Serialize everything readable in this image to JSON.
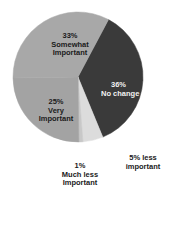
{
  "chart_data": {
    "type": "pie",
    "title": "",
    "start_angle_deg": 28,
    "direction": "clockwise",
    "slices": [
      {
        "label": "No change",
        "value": 36,
        "color": "#3a3a3a"
      },
      {
        "label": "5% less important",
        "value": 5,
        "color": "#dcdcdc"
      },
      {
        "label": "Much less Important",
        "value": 1,
        "color": "#c8c8c8"
      },
      {
        "label": "Very Important",
        "value": 25,
        "color": "#a3a3a3"
      },
      {
        "label": "Somewhat Important",
        "value": 33,
        "color": "#a8a8a8"
      }
    ],
    "legend": "none",
    "center": [
      78,
      77
    ],
    "radius": 65
  },
  "labels": {
    "no_change": {
      "pct": "36%",
      "line1": "No change"
    },
    "five_less": {
      "line1": "5% less",
      "line2": "important"
    },
    "much_less": {
      "pct": "1%",
      "line1": "Much less",
      "line2": "Important"
    },
    "very": {
      "pct": "25%",
      "line1": "Very",
      "line2": "Important"
    },
    "somewhat": {
      "pct": "33%",
      "line1": "Somewhat",
      "line2": "Important"
    }
  }
}
